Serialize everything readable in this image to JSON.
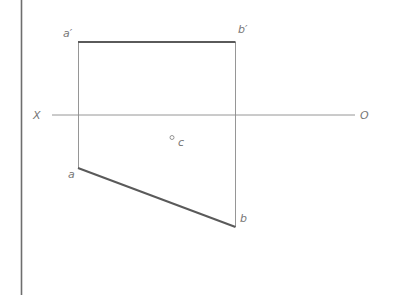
{
  "diagram": {
    "type": "orthographic-projection",
    "colors": {
      "border": "#6e6e6e",
      "thin_line": "#8a8a8a",
      "thick_line": "#5a5a5a",
      "label": "#777777"
    },
    "axis": {
      "left_label": "X",
      "right_label": "O"
    },
    "points": {
      "a_prime": "a′",
      "b_prime": "b′",
      "a": "a",
      "b": "b",
      "c": "c"
    }
  }
}
